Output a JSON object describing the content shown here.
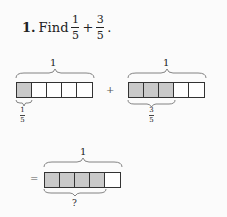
{
  "problem": {
    "number": "1.",
    "prompt": "Find",
    "fraction_a": {
      "num": "1",
      "den": "5"
    },
    "operator": "+",
    "fraction_b": {
      "num": "3",
      "den": "5"
    },
    "end": "."
  },
  "models": {
    "first": {
      "whole_label": "1",
      "parts": 5,
      "shaded": 1,
      "part_label": {
        "num": "1",
        "den": "5"
      }
    },
    "plus": "+",
    "second": {
      "whole_label": "1",
      "parts": 5,
      "shaded": 3,
      "part_label": {
        "num": "3",
        "den": "5"
      }
    },
    "equals": "=",
    "result": {
      "whole_label": "1",
      "parts": 5,
      "shaded": 4,
      "part_label": "?"
    }
  },
  "colors": {
    "shaded": "#c9c9c9",
    "border": "#333333"
  }
}
